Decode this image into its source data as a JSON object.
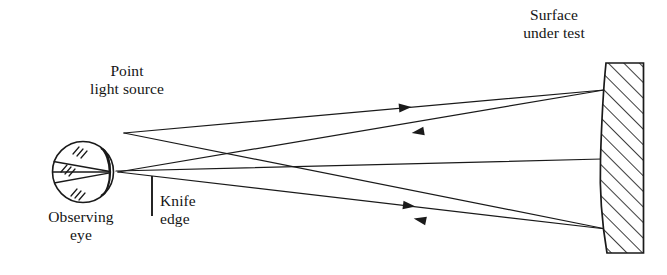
{
  "figure": {
    "type": "optical-ray-diagram",
    "background_color": "#ffffff",
    "line_color": "#1a1a1a",
    "labels": {
      "point_light_source": "Point\nlight source",
      "surface_under_test": "Surface\nunder test",
      "observing_eye": "Observing\neye",
      "knife_edge": "Knife\nedge"
    },
    "components": [
      {
        "name": "observing-eye",
        "shape": "circle-with-lens",
        "cx": 83,
        "cy": 172,
        "r": 31
      },
      {
        "name": "point-light-source",
        "shape": "vertex",
        "x": 124,
        "y": 133
      },
      {
        "name": "knife-edge",
        "shape": "vertical-line",
        "x": 152,
        "y_top": 176,
        "y_bottom": 216
      },
      {
        "name": "surface-under-test",
        "shape": "hatched-block-concave-left",
        "x_left": 604,
        "x_right": 644,
        "y_top": 62,
        "y_bottom": 254
      }
    ],
    "rays": [
      {
        "name": "outgoing-upper",
        "from": "point-light-source",
        "to": "mirror-top",
        "direction": "right",
        "arrow_at": [
          395,
          100
        ]
      },
      {
        "name": "returning-upper",
        "from": "mirror-top",
        "to": "knife-edge-focus",
        "direction": "left",
        "arrow_at": [
          416,
          118
        ]
      },
      {
        "name": "outgoing-lower",
        "from": "knife-edge-focus",
        "to": "mirror-bottom",
        "direction": "right",
        "arrow_at": [
          400,
          190
        ]
      },
      {
        "name": "returning-lower",
        "from": "mirror-bottom",
        "to": "point-light-source",
        "direction": "left",
        "arrow_at": [
          418,
          209
        ]
      },
      {
        "name": "axis-ray",
        "from": "knife-edge-focus",
        "to": "mirror-center",
        "direction": "right",
        "arrow_at": null
      }
    ]
  }
}
